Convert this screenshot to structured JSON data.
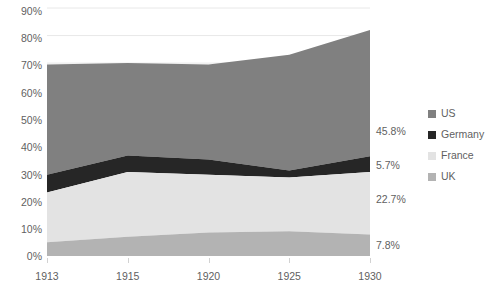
{
  "chart_data": {
    "type": "area",
    "stacked": true,
    "title": "",
    "xlabel": "",
    "ylabel": "",
    "categories": [
      "1913",
      "1915",
      "1920",
      "1925",
      "1930"
    ],
    "x_tick_labels": [
      "1913",
      "1915",
      "1920",
      "1925",
      "1930"
    ],
    "y_tick_labels": [
      "0%",
      "10%",
      "20%",
      "30%",
      "40%",
      "50%",
      "60%",
      "70%",
      "80%",
      "90%"
    ],
    "y_tick_values": [
      0,
      10,
      20,
      30,
      40,
      50,
      60,
      70,
      80,
      90
    ],
    "ylim": [
      0,
      90
    ],
    "y_unit": "%",
    "grid": "horizontal",
    "legend_position": "right",
    "stack_order_top_to_bottom": [
      "US",
      "Germany",
      "France",
      "UK"
    ],
    "series": [
      {
        "name": "US",
        "color": "#808080",
        "values": [
          40.0,
          33.5,
          34.5,
          42.0,
          45.8
        ],
        "end_label": "45.8%"
      },
      {
        "name": "Germany",
        "color": "#262626",
        "values": [
          6.5,
          6.0,
          5.5,
          2.5,
          5.7
        ],
        "end_label": "5.7%"
      },
      {
        "name": "France",
        "color": "#e3e3e3",
        "values": [
          18.0,
          23.5,
          21.0,
          19.5,
          22.7
        ],
        "end_label": "22.7%"
      },
      {
        "name": "UK",
        "color": "#b3b3b3",
        "values": [
          5.0,
          7.0,
          8.5,
          9.0,
          7.8
        ],
        "end_label": "7.8%"
      }
    ],
    "cumulative_tops": {
      "UK": [
        5.0,
        7.0,
        8.5,
        9.0,
        7.8
      ],
      "France": [
        23.0,
        30.5,
        29.5,
        28.5,
        30.5
      ],
      "Germany": [
        29.5,
        36.5,
        35.0,
        31.0,
        36.2
      ],
      "US": [
        69.5,
        70.0,
        69.5,
        73.0,
        82.0
      ]
    },
    "gridline_color": "#e8e8e8",
    "axis_text_color": "#5f5f5f"
  },
  "legend": {
    "items": [
      {
        "label": "US",
        "color": "#808080"
      },
      {
        "label": "Germany",
        "color": "#262626"
      },
      {
        "label": "France",
        "color": "#e3e3e3"
      },
      {
        "label": "UK",
        "color": "#b3b3b3"
      }
    ]
  },
  "value_labels": [
    {
      "text": "45.8%",
      "series": "US"
    },
    {
      "text": "5.7%",
      "series": "Germany"
    },
    {
      "text": "22.7%",
      "series": "France"
    },
    {
      "text": "7.8%",
      "series": "UK"
    }
  ]
}
